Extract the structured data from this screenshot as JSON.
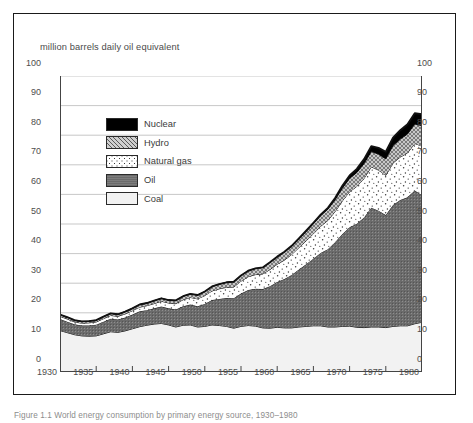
{
  "chart_title": "million barrels daily oil equivalent",
  "caption": "Figure 1.1  World energy consumption by primary energy source, 1930–1980",
  "legend": {
    "items": [
      {
        "label": "Nuclear",
        "key": "nuclear",
        "fill": "#000000"
      },
      {
        "label": "Hydro",
        "key": "hydro",
        "fill": "#b5b5b5"
      },
      {
        "label": "Natural gas",
        "key": "natural_gas",
        "fill": "#fbfbfb"
      },
      {
        "label": "Oil",
        "key": "oil",
        "fill": "#6e6e6e"
      },
      {
        "label": "Coal",
        "key": "coal",
        "fill": "#f0f0f0"
      }
    ]
  },
  "chart_data": {
    "type": "area",
    "stacked": true,
    "title": "million barrels daily oil equivalent",
    "xlabel": "",
    "ylabel": "million barrels daily oil equivalent",
    "xlim": [
      1930,
      1980
    ],
    "ylim": [
      0,
      100
    ],
    "ytick_step": 10,
    "xtick_step": 5,
    "grid": true,
    "legend_position": "inside-upper-left",
    "axes_labels_both_sides": true,
    "ytick_labels": [
      "0",
      "10",
      "20",
      "30",
      "40",
      "50",
      "60",
      "70",
      "80",
      "90",
      "100"
    ],
    "xtick_labels": [
      "1930",
      "1935",
      "1940",
      "1945",
      "1950",
      "1955",
      "1960",
      "1965",
      "1970",
      "1975",
      "1980"
    ],
    "x": [
      1930,
      1931,
      1932,
      1933,
      1934,
      1935,
      1936,
      1937,
      1938,
      1939,
      1940,
      1941,
      1942,
      1943,
      1944,
      1945,
      1946,
      1947,
      1948,
      1949,
      1950,
      1951,
      1952,
      1953,
      1954,
      1955,
      1956,
      1957,
      1958,
      1959,
      1960,
      1961,
      1962,
      1963,
      1964,
      1965,
      1966,
      1967,
      1968,
      1969,
      1970,
      1971,
      1972,
      1973,
      1974,
      1975,
      1976,
      1977,
      1978,
      1979,
      1980
    ],
    "series": [
      {
        "name": "Coal",
        "key": "coal",
        "fill": "#f0f0f0",
        "values": [
          14.0,
          13.3,
          12.6,
          12.2,
          12.1,
          12.2,
          12.9,
          13.6,
          13.4,
          13.9,
          14.6,
          15.3,
          15.8,
          16.2,
          16.4,
          15.9,
          15.2,
          15.8,
          15.9,
          15.2,
          15.4,
          15.9,
          15.7,
          15.4,
          14.8,
          15.4,
          15.7,
          15.5,
          14.9,
          14.8,
          15.1,
          14.9,
          14.9,
          15.2,
          15.4,
          15.6,
          15.6,
          15.2,
          15.2,
          15.4,
          15.5,
          15.1,
          15.0,
          15.2,
          15.2,
          15.0,
          15.4,
          15.6,
          15.6,
          16.3,
          16.8
        ]
      },
      {
        "name": "Oil",
        "key": "oil",
        "fill": "#6e6e6e",
        "values": [
          3.9,
          3.7,
          3.5,
          3.5,
          3.6,
          3.8,
          4.1,
          4.4,
          4.3,
          4.5,
          4.8,
          5.2,
          5.1,
          5.3,
          5.7,
          5.6,
          5.9,
          6.4,
          6.9,
          7.0,
          7.6,
          8.4,
          9.0,
          9.6,
          10.1,
          11.1,
          12.0,
          12.6,
          13.1,
          14.2,
          15.3,
          16.5,
          17.9,
          19.4,
          21.0,
          22.7,
          24.6,
          26.3,
          28.6,
          31.2,
          33.4,
          35.0,
          37.2,
          40.3,
          39.3,
          38.0,
          41.0,
          42.5,
          43.4,
          45.0,
          42.9
        ]
      },
      {
        "name": "Natural gas",
        "key": "natural_gas",
        "fill": "#fbfbfb",
        "values": [
          0.9,
          0.9,
          0.8,
          0.8,
          0.9,
          0.9,
          1.0,
          1.1,
          1.1,
          1.2,
          1.3,
          1.4,
          1.5,
          1.6,
          1.8,
          1.8,
          2.0,
          2.2,
          2.4,
          2.5,
          2.8,
          3.1,
          3.4,
          3.6,
          3.8,
          4.2,
          4.5,
          4.8,
          5.1,
          5.6,
          6.0,
          6.4,
          6.9,
          7.4,
          7.9,
          8.4,
          9.0,
          9.7,
          10.4,
          11.2,
          12.0,
          12.6,
          13.2,
          13.8,
          13.7,
          13.4,
          14.2,
          14.5,
          15.0,
          15.9,
          16.6
        ]
      },
      {
        "name": "Hydro",
        "key": "hydro",
        "fill": "#b5b5b5",
        "values": [
          0.6,
          0.6,
          0.6,
          0.6,
          0.6,
          0.6,
          0.7,
          0.7,
          0.7,
          0.8,
          0.8,
          0.9,
          0.9,
          1.0,
          1.0,
          1.0,
          1.1,
          1.2,
          1.2,
          1.3,
          1.4,
          1.5,
          1.6,
          1.7,
          1.8,
          1.9,
          2.0,
          2.1,
          2.2,
          2.4,
          2.5,
          2.7,
          2.8,
          3.0,
          3.2,
          3.4,
          3.6,
          3.8,
          4.0,
          4.3,
          4.5,
          4.7,
          5.0,
          5.2,
          5.4,
          5.6,
          5.9,
          6.1,
          6.4,
          6.6,
          6.9
        ]
      },
      {
        "name": "Nuclear",
        "key": "nuclear",
        "fill": "#000000",
        "values": [
          0,
          0,
          0,
          0,
          0,
          0,
          0,
          0,
          0,
          0,
          0,
          0,
          0,
          0,
          0,
          0,
          0,
          0,
          0,
          0,
          0,
          0,
          0,
          0,
          0,
          0,
          0,
          0.02,
          0.03,
          0.05,
          0.07,
          0.1,
          0.13,
          0.17,
          0.22,
          0.28,
          0.35,
          0.45,
          0.6,
          0.8,
          1.0,
          1.2,
          1.5,
          1.8,
          2.1,
          2.4,
          2.7,
          3.0,
          3.3,
          3.6,
          3.9
        ]
      }
    ],
    "totals": [
      19.4,
      18.5,
      17.5,
      17.1,
      17.2,
      17.5,
      18.7,
      19.8,
      19.5,
      20.4,
      21.5,
      22.8,
      23.3,
      24.1,
      24.9,
      24.3,
      24.2,
      25.6,
      26.4,
      26.0,
      27.2,
      28.9,
      29.7,
      30.3,
      30.5,
      32.6,
      34.2,
      35.0,
      35.3,
      37.0,
      38.9,
      40.6,
      42.6,
      45.2,
      47.7,
      50.4,
      53.2,
      55.4,
      58.8,
      62.9,
      66.4,
      68.6,
      71.9,
      76.3,
      75.7,
      74.4,
      79.2,
      81.7,
      83.7,
      87.4,
      87.1
    ]
  }
}
